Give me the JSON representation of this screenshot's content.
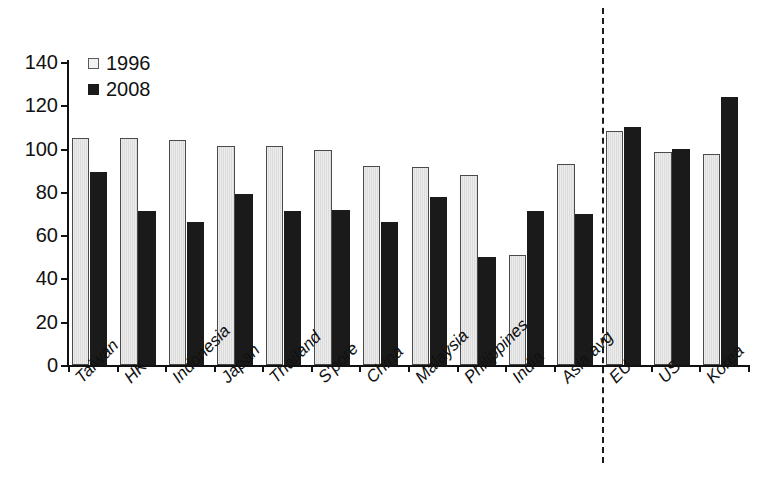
{
  "chart_data": {
    "type": "bar",
    "title": "",
    "subtitle": "",
    "xlabel": "",
    "ylabel": "",
    "ylim": [
      0,
      140
    ],
    "yticks": [
      0,
      20,
      40,
      60,
      80,
      100,
      120,
      140
    ],
    "grid": false,
    "legend_position": "top-left",
    "categories": [
      "Taiwan",
      "HK",
      "Indonesia",
      "Japan",
      "Thailand",
      "S'pore",
      "China",
      "Malaysia",
      "Philippines",
      "India",
      "Asia avg",
      "EU",
      "US",
      "Korea"
    ],
    "series": [
      {
        "name": "1996",
        "color": "#e8e8e8",
        "values": [
          105,
          105,
          104,
          101,
          101,
          99.5,
          92,
          91.5,
          88,
          51,
          93,
          108,
          98.5,
          97.5
        ]
      },
      {
        "name": "2008",
        "color": "#1a1a1a",
        "values": [
          89,
          71,
          66,
          79,
          71,
          71.5,
          66,
          77.5,
          50,
          71,
          70,
          110,
          100,
          124
        ]
      }
    ],
    "annotations": [
      {
        "name": "asia-vs-rest-divider",
        "type": "vertical-dashed-line",
        "after_category": "Asia avg"
      }
    ]
  },
  "legend": {
    "items": [
      {
        "label": "1996",
        "swatch": "light-square-swatch"
      },
      {
        "label": "2008",
        "swatch": "black-square-swatch"
      }
    ]
  },
  "axis": {
    "y_tick_labels": [
      "0",
      "20",
      "40",
      "60",
      "80",
      "100",
      "120",
      "140"
    ]
  }
}
